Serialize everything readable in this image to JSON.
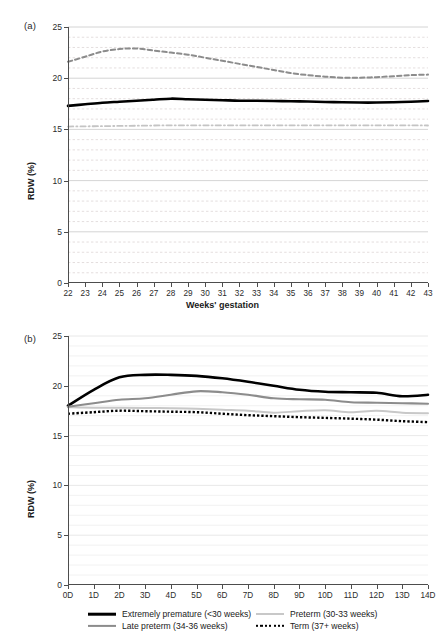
{
  "figure": {
    "panels": [
      {
        "tag": "(a)",
        "ylabel": "RDW (%)",
        "xlabel": "Weeks' gestation"
      },
      {
        "tag": "(b)",
        "ylabel": "RDW (%)",
        "xlabel": ""
      }
    ]
  },
  "legend": {
    "items": [
      {
        "label": "Extremely premature (<30 weeks)",
        "color": "#000000",
        "style": "solid",
        "width": 2.6
      },
      {
        "label": "Preterm (30-33 weeks)",
        "color": "#c8c8c8",
        "style": "solid",
        "width": 2.0
      },
      {
        "label": "Late preterm (34-36 weeks)",
        "color": "#8c8c8c",
        "style": "solid",
        "width": 2.2
      },
      {
        "label": "Term (37+ weeks)",
        "color": "#000000",
        "style": "dotted",
        "width": 2.4
      }
    ]
  },
  "chart_data": [
    {
      "type": "line",
      "panel": "(a)",
      "title": "",
      "xlabel": "Weeks' gestation",
      "ylabel": "RDW (%)",
      "xlim": [
        22,
        43
      ],
      "ylim": [
        0,
        25
      ],
      "yticks": [
        0,
        5,
        10,
        15,
        20,
        25
      ],
      "grid": true,
      "grid_minor_step": 1,
      "legend_position": "none",
      "categories": [
        "22",
        "23",
        "24",
        "25",
        "26",
        "27",
        "28",
        "29",
        "30",
        "31",
        "32",
        "33",
        "34",
        "35",
        "36",
        "37",
        "38",
        "39",
        "40",
        "41",
        "42",
        "43"
      ],
      "series": [
        {
          "name": "upper-percentile",
          "color": "#8c8c8c",
          "style": "dashed",
          "width": 2.0,
          "values": [
            21.6,
            22.1,
            22.6,
            22.85,
            22.9,
            22.7,
            22.5,
            22.3,
            22.0,
            21.7,
            21.4,
            21.1,
            20.8,
            20.5,
            20.3,
            20.15,
            20.05,
            20.05,
            20.1,
            20.2,
            20.3,
            20.35
          ]
        },
        {
          "name": "median",
          "color": "#000000",
          "style": "solid",
          "width": 2.6,
          "values": [
            17.3,
            17.45,
            17.6,
            17.7,
            17.8,
            17.9,
            18.0,
            17.95,
            17.9,
            17.85,
            17.8,
            17.8,
            17.78,
            17.75,
            17.72,
            17.68,
            17.65,
            17.62,
            17.62,
            17.65,
            17.7,
            17.78
          ]
        },
        {
          "name": "lower-percentile",
          "color": "#c4c4c4",
          "style": "dashdot",
          "width": 1.8,
          "values": [
            15.28,
            15.3,
            15.32,
            15.34,
            15.36,
            15.38,
            15.4,
            15.4,
            15.4,
            15.4,
            15.4,
            15.4,
            15.4,
            15.4,
            15.4,
            15.4,
            15.4,
            15.4,
            15.4,
            15.4,
            15.4,
            15.38
          ]
        }
      ]
    },
    {
      "type": "line",
      "panel": "(b)",
      "title": "",
      "xlabel": "",
      "ylabel": "RDW (%)",
      "xlim": [
        0,
        14
      ],
      "ylim": [
        0,
        25
      ],
      "yticks": [
        0,
        5,
        10,
        15,
        20,
        25
      ],
      "grid": true,
      "grid_minor_step": 1,
      "legend_position": "bottom",
      "categories": [
        "0D",
        "1D",
        "2D",
        "3D",
        "4D",
        "5D",
        "6D",
        "7D",
        "8D",
        "9D",
        "10D",
        "11D",
        "12D",
        "13D",
        "14D"
      ],
      "series": [
        {
          "name": "Extremely premature (<30 weeks)",
          "color": "#000000",
          "style": "solid",
          "width": 2.6,
          "values": [
            18.0,
            19.6,
            20.85,
            21.1,
            21.1,
            21.0,
            20.75,
            20.4,
            20.0,
            19.6,
            19.4,
            19.35,
            19.3,
            18.95,
            19.1
          ]
        },
        {
          "name": "Preterm (30-33 weeks)",
          "color": "#c8c8c8",
          "style": "solid",
          "width": 2.0,
          "values": [
            17.85,
            17.8,
            17.8,
            17.78,
            17.75,
            17.7,
            17.6,
            17.5,
            17.3,
            17.45,
            17.55,
            17.35,
            17.5,
            17.3,
            17.25
          ]
        },
        {
          "name": "Late preterm (34-36 weeks)",
          "color": "#8c8c8c",
          "style": "solid",
          "width": 2.2,
          "values": [
            17.9,
            18.25,
            18.6,
            18.75,
            19.1,
            19.45,
            19.35,
            19.1,
            18.75,
            18.65,
            18.6,
            18.35,
            18.3,
            18.25,
            18.2
          ]
        },
        {
          "name": "Term (37+ weeks)",
          "color": "#000000",
          "style": "dotted",
          "width": 2.4,
          "values": [
            17.2,
            17.35,
            17.5,
            17.45,
            17.4,
            17.35,
            17.2,
            17.05,
            16.95,
            16.85,
            16.78,
            16.7,
            16.6,
            16.45,
            16.35
          ]
        }
      ]
    }
  ]
}
